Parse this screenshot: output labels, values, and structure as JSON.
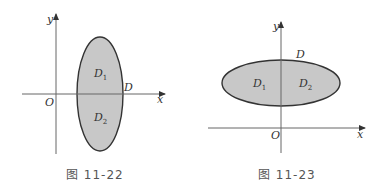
{
  "figures": [
    {
      "caption": "图 11-22",
      "axes": {
        "x_label": "x",
        "y_label": "y",
        "origin_label": "O"
      },
      "region": {
        "shape": "vertical ellipse",
        "fill": "#c8c8c8",
        "boundary_label": "D"
      },
      "subregions": [
        {
          "label": "D",
          "sub": "1"
        },
        {
          "label": "D",
          "sub": "2"
        }
      ]
    },
    {
      "caption": "图 11-23",
      "axes": {
        "x_label": "x",
        "y_label": "y",
        "origin_label": "O"
      },
      "region": {
        "shape": "horizontal ellipse",
        "fill": "#c8c8c8",
        "boundary_label": "D"
      },
      "subregions": [
        {
          "label": "D",
          "sub": "1"
        },
        {
          "label": "D",
          "sub": "2"
        }
      ]
    }
  ],
  "colors": {
    "fill": "#c8c8c8",
    "stroke": "#333333",
    "axis": "#555555"
  }
}
